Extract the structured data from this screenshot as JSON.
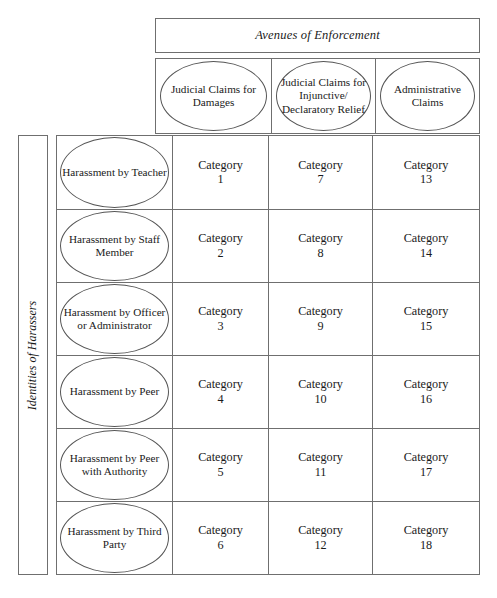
{
  "figure": {
    "column_axis_title": "Avenues of Enforcement",
    "row_axis_title": "Identities of Harassers",
    "category_word": "Category"
  },
  "columns": [
    {
      "label": "Judicial Claims for Damages"
    },
    {
      "label": "Judicial Claims for Injunctive/ Declaratory Relief"
    },
    {
      "label": "Administrative Claims"
    }
  ],
  "rows": [
    {
      "label": "Harassment by Teacher"
    },
    {
      "label": "Harassment by Staff Member"
    },
    {
      "label": "Harassment by Officer or Administrator"
    },
    {
      "label": "Harassment by Peer"
    },
    {
      "label": "Harassment by Peer with Authority"
    },
    {
      "label": "Harassment by Third Party"
    }
  ],
  "cells": [
    [
      {
        "word": "Category",
        "number": "1"
      },
      {
        "word": "Category",
        "number": "7"
      },
      {
        "word": "Category",
        "number": "13"
      }
    ],
    [
      {
        "word": "Category",
        "number": "2"
      },
      {
        "word": "Category",
        "number": "8"
      },
      {
        "word": "Category",
        "number": "14"
      }
    ],
    [
      {
        "word": "Category",
        "number": "3"
      },
      {
        "word": "Category",
        "number": "9"
      },
      {
        "word": "Category",
        "number": "15"
      }
    ],
    [
      {
        "word": "Category",
        "number": "4"
      },
      {
        "word": "Category",
        "number": "10"
      },
      {
        "word": "Category",
        "number": "16"
      }
    ],
    [
      {
        "word": "Category",
        "number": "5"
      },
      {
        "word": "Category",
        "number": "11"
      },
      {
        "word": "Category",
        "number": "17"
      }
    ],
    [
      {
        "word": "Category",
        "number": "6"
      },
      {
        "word": "Category",
        "number": "12"
      },
      {
        "word": "Category",
        "number": "18"
      }
    ]
  ],
  "colors": {
    "background": "#ffffff",
    "border": "#6f6f6f",
    "ellipse_border": "#555555",
    "text": "#1a1a1a"
  }
}
